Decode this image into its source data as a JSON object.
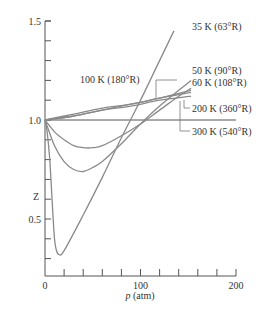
{
  "chart_data": {
    "type": "line",
    "title": "",
    "xlabel": "p (atm)",
    "xlabel_italic_part": "p",
    "xlabel_rest": " (atm)",
    "ylabel": "Z",
    "xlim": [
      0,
      200
    ],
    "ylim": [
      0.2,
      1.5
    ],
    "x_ticks": [
      0,
      100,
      200
    ],
    "x_minor_ticks_every": 20,
    "y_ticks": [
      0.5,
      1.0,
      1.5
    ],
    "y_tick_labels": [
      "0.5",
      "1.0",
      "1.5"
    ],
    "y_minor_ticks_every": 0.1,
    "grid": false,
    "reference_line": {
      "y": 1.0,
      "x_end": 200
    },
    "series": [
      {
        "name": "35 K (63°R)",
        "label": "35 K (63°R)",
        "points": [
          [
            0,
            1.0
          ],
          [
            2,
            0.95
          ],
          [
            5,
            0.8
          ],
          [
            8,
            0.55
          ],
          [
            10,
            0.4
          ],
          [
            12,
            0.34
          ],
          [
            15,
            0.32
          ],
          [
            20,
            0.34
          ],
          [
            40,
            0.52
          ],
          [
            60,
            0.71
          ],
          [
            80,
            0.91
          ],
          [
            100,
            1.1
          ],
          [
            120,
            1.3
          ],
          [
            135,
            1.45
          ]
        ]
      },
      {
        "name": "50 K (90°R)",
        "label": "50 K (90°R)",
        "points": [
          [
            0,
            1.0
          ],
          [
            10,
            0.87
          ],
          [
            20,
            0.79
          ],
          [
            30,
            0.75
          ],
          [
            40,
            0.74
          ],
          [
            50,
            0.76
          ],
          [
            60,
            0.79
          ],
          [
            80,
            0.88
          ],
          [
            100,
            0.98
          ],
          [
            120,
            1.07
          ],
          [
            140,
            1.15
          ],
          [
            153,
            1.2
          ]
        ]
      },
      {
        "name": "60 K (108°R)",
        "label": "60 K (108°R)",
        "points": [
          [
            0,
            1.0
          ],
          [
            10,
            0.94
          ],
          [
            20,
            0.9
          ],
          [
            30,
            0.87
          ],
          [
            40,
            0.86
          ],
          [
            50,
            0.86
          ],
          [
            60,
            0.87
          ],
          [
            80,
            0.92
          ],
          [
            100,
            0.98
          ],
          [
            120,
            1.05
          ],
          [
            140,
            1.12
          ],
          [
            153,
            1.16
          ]
        ]
      },
      {
        "name": "100 K (180°R)",
        "label": "100 K (180°R)",
        "points": [
          [
            0,
            1.0
          ],
          [
            30,
            1.02
          ],
          [
            60,
            1.05
          ],
          [
            90,
            1.08
          ],
          [
            120,
            1.11
          ],
          [
            153,
            1.15
          ]
        ]
      },
      {
        "name": "200 K (360°R)",
        "label": "200 K (360°R)",
        "points": [
          [
            0,
            1.0
          ],
          [
            30,
            1.03
          ],
          [
            60,
            1.06
          ],
          [
            90,
            1.08
          ],
          [
            120,
            1.11
          ],
          [
            153,
            1.14
          ]
        ]
      },
      {
        "name": "300 K (540°R)",
        "label": "300 K (540°R)",
        "points": [
          [
            0,
            1.0
          ],
          [
            30,
            1.02
          ],
          [
            60,
            1.05
          ],
          [
            90,
            1.07
          ],
          [
            120,
            1.1
          ],
          [
            153,
            1.12
          ]
        ]
      }
    ],
    "annotations": [
      {
        "text": "35 K (63°R)",
        "target_series": "35 K (63°R)"
      },
      {
        "text": "50 K (90°R)",
        "target_series": "50 K (90°R)"
      },
      {
        "text": "60 K (108°R)",
        "target_series": "60 K (108°R)"
      },
      {
        "text": "100 K (180°R)",
        "target_series": "100 K (180°R)"
      },
      {
        "text": "200 K (360°R)",
        "target_series": "200 K (360°R)"
      },
      {
        "text": "300 K (540°R)",
        "target_series": "300 K (540°R)"
      }
    ],
    "legend": "none (inline annotations)",
    "colors": {
      "curves": "#8a8a8a",
      "axes": "#555555",
      "text": "#333333"
    }
  }
}
